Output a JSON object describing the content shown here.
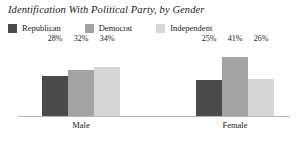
{
  "chart_data": {
    "type": "bar",
    "title": "Identification With Political Party, by Gender",
    "xlabel": "",
    "ylabel": "",
    "ylim": [
      0,
      50
    ],
    "grid": false,
    "legend_position": "top-left",
    "categories": [
      "Male",
      "Female"
    ],
    "series": [
      {
        "name": "Republican",
        "color": "#4a4a4a",
        "values": [
          28,
          25
        ],
        "labels": [
          "28%",
          "25%"
        ]
      },
      {
        "name": "Democrat",
        "color": "#a3a3a3",
        "values": [
          32,
          41
        ],
        "labels": [
          "32%",
          "41%"
        ]
      },
      {
        "name": "Independent",
        "color": "#d6d6d6",
        "values": [
          34,
          26
        ],
        "labels": [
          "34%",
          "26%"
        ]
      }
    ]
  },
  "chart": {
    "title": "Identification With Political Party, by Gender",
    "legend": [
      {
        "label": "Republican",
        "color": "#4a4a4a"
      },
      {
        "label": "Democrat",
        "color": "#a3a3a3"
      },
      {
        "label": "Independent",
        "color": "#d6d6d6"
      }
    ],
    "groups": [
      {
        "label": "Male",
        "bars": [
          {
            "series": "Republican",
            "value_label": "28%",
            "color": "#4a4a4a",
            "height_px": 40
          },
          {
            "series": "Democrat",
            "value_label": "32%",
            "color": "#a3a3a3",
            "height_px": 46
          },
          {
            "series": "Independent",
            "value_label": "34%",
            "color": "#d6d6d6",
            "height_px": 49
          }
        ]
      },
      {
        "label": "Female",
        "bars": [
          {
            "series": "Republican",
            "value_label": "25%",
            "color": "#4a4a4a",
            "height_px": 36
          },
          {
            "series": "Democrat",
            "value_label": "41%",
            "color": "#a3a3a3",
            "height_px": 59
          },
          {
            "series": "Independent",
            "value_label": "26%",
            "color": "#d6d6d6",
            "height_px": 37
          }
        ]
      }
    ],
    "axis_color": "#b5b5b5"
  }
}
